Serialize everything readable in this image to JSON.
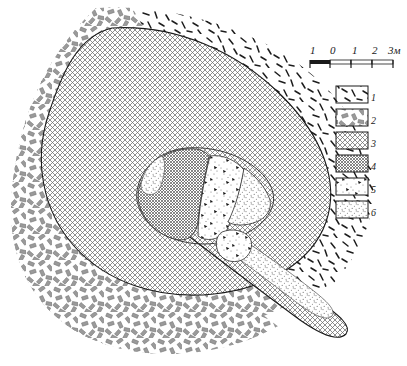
{
  "figure": {
    "kind": "archaeological-site-plan"
  },
  "scale_bar": {
    "name": "scale-bar",
    "ticks": [
      "1",
      "0",
      "1",
      "2",
      "3м"
    ],
    "unit_label": "м",
    "segments": 4
  },
  "legend": {
    "name": "legend",
    "items": [
      {
        "number": "1",
        "pattern": "thin-dark-dashes"
      },
      {
        "number": "2",
        "pattern": "gray-blocks"
      },
      {
        "number": "3",
        "pattern": "coarse-crosshatch"
      },
      {
        "number": "4",
        "pattern": "fine-crosshatch"
      },
      {
        "number": "5",
        "pattern": "stipple-with-stars"
      },
      {
        "number": "6",
        "pattern": "fine-stipple"
      }
    ]
  },
  "plan": {
    "name": "site-plan",
    "zones": [
      {
        "id": "outer-ring-dashes",
        "legend_ref": "1"
      },
      {
        "id": "outer-ring-blocks",
        "legend_ref": "2"
      },
      {
        "id": "mound-body",
        "legend_ref": "3"
      },
      {
        "id": "inner-chamber-west",
        "legend_ref": "4"
      },
      {
        "id": "inner-chamber-fill",
        "legend_ref": "5"
      },
      {
        "id": "chamber-channel",
        "legend_ref": "6"
      }
    ]
  },
  "colors": {
    "ink": "#1a1a1a",
    "gray_fill": "#9a9a9a",
    "light_gray": "#cfcfcf",
    "paper": "#ffffff"
  }
}
